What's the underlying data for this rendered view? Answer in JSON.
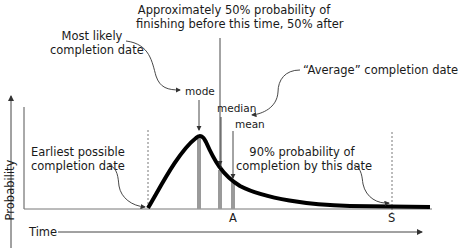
{
  "annotations": {
    "median_note_line1": "Approximately 50% probability of",
    "median_note_line2": "finishing before this time, 50% after",
    "mode_note_line1": "Most likely",
    "mode_note_line2": "completion date",
    "mean_note": "“Average” completion date",
    "earliest_note_line1": "Earliest possible",
    "earliest_note_line2": "completion date",
    "ninety_note_line1": "90% probability of",
    "ninety_note_line2": "completion by this date"
  },
  "markers": {
    "mode": "mode",
    "median": "median",
    "mean": "mean"
  },
  "axes": {
    "y_label": "Probability",
    "x_label": "Time",
    "tick_a": "A",
    "tick_s": "S"
  },
  "colors": {
    "curve": "#000000",
    "bars": "#9a9a9a",
    "axis": "#444444"
  }
}
